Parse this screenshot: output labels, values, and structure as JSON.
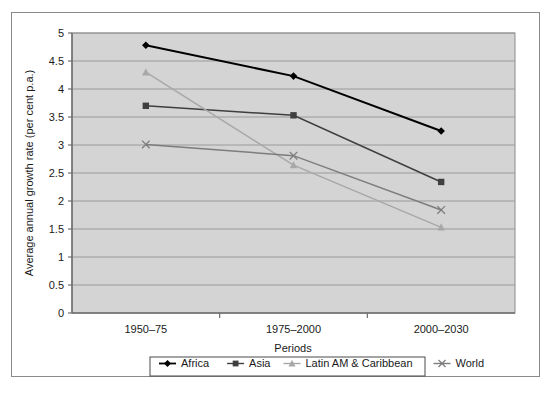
{
  "chart_data": {
    "type": "line",
    "title": "",
    "xlabel": "Periods",
    "ylabel": "Average annual growth rate (per cent p.a.)",
    "categories": [
      "1950–75",
      "1975–2000",
      "2000–2030"
    ],
    "ylim": [
      0,
      5
    ],
    "ytick_step": 0.5,
    "yticks": [
      "0",
      "0.5",
      "1",
      "1.5",
      "2",
      "2.5",
      "3",
      "3.5",
      "4",
      "4.5",
      "5"
    ],
    "grid": "horizontal",
    "legend_position": "bottom",
    "plot_background": "#d4d4d4",
    "gridline_color": "#9a9a9a",
    "series": [
      {
        "name": "Africa",
        "marker": "diamond",
        "color": "#000000",
        "values": [
          4.78,
          4.23,
          3.25
        ]
      },
      {
        "name": "Asia",
        "marker": "square",
        "color": "#3f3f3f",
        "values": [
          3.7,
          3.53,
          2.34
        ]
      },
      {
        "name": "Latin AM & Caribbean",
        "marker": "triangle",
        "color": "#a8a8a8",
        "values": [
          4.3,
          2.64,
          1.53
        ]
      },
      {
        "name": "World",
        "marker": "cross",
        "color": "#7d7d7d",
        "values": [
          3.01,
          2.81,
          1.84
        ]
      }
    ]
  },
  "legend": {
    "items": [
      {
        "label": "Africa"
      },
      {
        "label": "Asia"
      },
      {
        "label": "Latin AM & Caribbean"
      },
      {
        "label": "World"
      }
    ]
  }
}
